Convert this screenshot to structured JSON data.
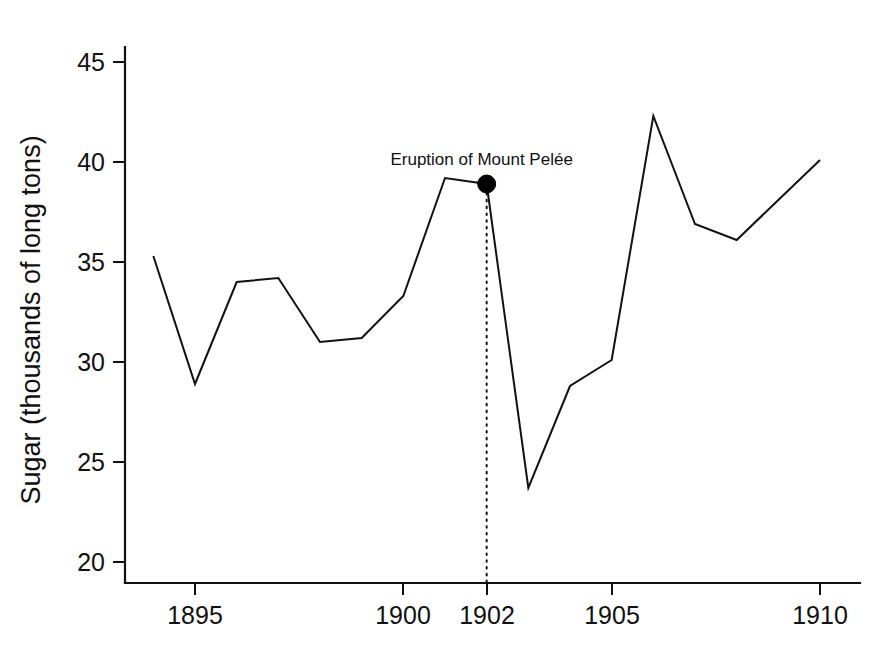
{
  "chart_data": {
    "type": "line",
    "title": "",
    "xlabel": "",
    "ylabel": "Sugar (thousands of long tons)",
    "xlim": [
      1893.5,
      1910.6
    ],
    "ylim": [
      19.0,
      46.2
    ],
    "grid": false,
    "legend": "none",
    "x": [
      1894,
      1895,
      1896,
      1897,
      1898,
      1899,
      1900,
      1901,
      1902,
      1903,
      1904,
      1905,
      1906,
      1907,
      1908,
      1909,
      1910
    ],
    "values": [
      35.3,
      28.9,
      34.0,
      34.2,
      31.0,
      31.2,
      33.3,
      39.2,
      38.9,
      23.7,
      28.8,
      30.1,
      42.3,
      36.9,
      36.1,
      38.1,
      40.1
    ],
    "series": [
      {
        "name": "Sugar production",
        "values": [
          35.3,
          28.9,
          34.0,
          34.2,
          31.0,
          31.2,
          33.3,
          39.2,
          38.9,
          23.7,
          28.8,
          30.1,
          42.3,
          36.9,
          36.1,
          38.1,
          40.1
        ]
      }
    ],
    "xticks": [
      1895,
      1900,
      1902,
      1905,
      1910
    ],
    "xticklabels": [
      "1895",
      "1900",
      "1902",
      "1905",
      "1910"
    ],
    "yticks": [
      20,
      25,
      30,
      35,
      40,
      45
    ],
    "yticklabels": [
      "20",
      "25",
      "30",
      "35",
      "40",
      "45"
    ],
    "annotations": [
      {
        "text": "Eruption of Mount Pelée",
        "x": 1902,
        "y": 38.9,
        "marker": "filled-circle",
        "guide": "vertical-dotted-to-axis"
      }
    ],
    "line_color": "#111111",
    "marker_color": "#000000",
    "background_color": "#ffffff"
  },
  "axis": {
    "y_title": "Sugar (thousands of long tons)"
  }
}
